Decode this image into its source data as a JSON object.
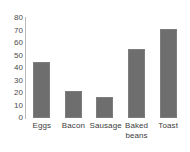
{
  "chart_data": {
    "type": "bar",
    "title": "",
    "xlabel": "",
    "ylabel": "",
    "categories": [
      "Eggs",
      "Bacon",
      "Sausage",
      "Baked beans",
      "Toast"
    ],
    "category_lines": [
      [
        "Eggs"
      ],
      [
        "Bacon"
      ],
      [
        "Sausage"
      ],
      [
        "Baked",
        "beans"
      ],
      [
        "Toast"
      ]
    ],
    "values": [
      45,
      22,
      17,
      55,
      71
    ],
    "ylim": [
      0,
      80
    ],
    "ytick_step": 10,
    "yticks": [
      80,
      70,
      60,
      50,
      40,
      30,
      20,
      10,
      0
    ],
    "ytick_labels": [
      "80",
      "70",
      "60",
      "50",
      "40",
      "30",
      "20",
      "10",
      "0"
    ],
    "grid": false,
    "legend": false,
    "legend_position": "none",
    "orientation": "vertical"
  },
  "style": {
    "bar_color": "#6e6e6e",
    "bar_edge_color": "#7d7d7d",
    "axis_line_color": "#b9b9b9",
    "tick_label_color": "#4a4a4a",
    "category_label_color": "#3d3d3d",
    "background_color": "#ffffff"
  }
}
